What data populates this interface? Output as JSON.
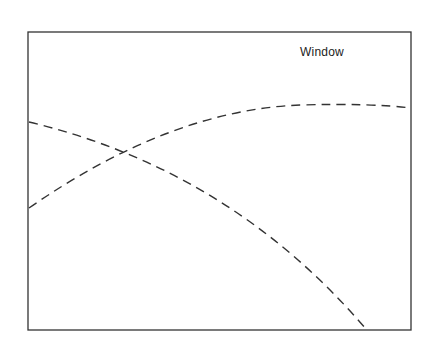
{
  "diagram": {
    "title_label": "Window",
    "frame": {
      "x1": 28,
      "y1": 32,
      "x2": 411,
      "y2": 330
    },
    "stroke_color": "#333333",
    "curves": [
      {
        "name": "rising-curve",
        "style": "dashed",
        "path": "M 29 208 Q 170 110 300 105 Q 370 103 411 108"
      },
      {
        "name": "falling-curve",
        "style": "dashed",
        "path": "M 29 122 Q 230 170 366 329"
      }
    ],
    "intersection": {
      "x": 127,
      "y": 153
    }
  }
}
